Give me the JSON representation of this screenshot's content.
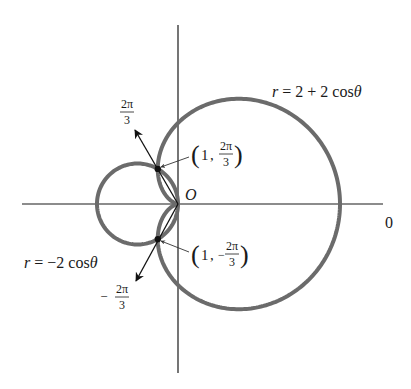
{
  "figure": {
    "type": "polar-graph",
    "origin_label": "O",
    "polar_axis_label": "0",
    "colors": {
      "curve": "#6b6b6b",
      "axis": "#1a1a1a",
      "point": "#111111",
      "text": "#1a1a1a",
      "background": "#ffffff"
    },
    "geometry": {
      "origin_px": [
        178,
        204
      ],
      "scale_px_per_unit": 40.5
    }
  },
  "curves": [
    {
      "id": "cardioid",
      "equation_label": {
        "lhs": "r",
        "eq": " = ",
        "rhs": "2 + 2 cos",
        "theta": "θ"
      },
      "formula": "r = 2 + 2cosθ"
    },
    {
      "id": "circle",
      "equation_label": {
        "lhs": "r",
        "eq": " = ",
        "rhs": "−2 cos",
        "theta": "θ"
      },
      "formula": "r = −2cosθ"
    }
  ],
  "rays": [
    {
      "angle_label": {
        "sign": "",
        "num": "2π",
        "den": "3"
      },
      "angle": "2π/3"
    },
    {
      "angle_label": {
        "sign": "−",
        "num": "2π",
        "den": "3"
      },
      "angle": "−2π/3"
    }
  ],
  "intersections": [
    {
      "r": "1",
      "sign": "",
      "num": "2π",
      "den": "3",
      "label": "(1, 2π/3)"
    },
    {
      "r": "1",
      "sign": "−",
      "num": "2π",
      "den": "3",
      "label": "(1, −2π/3)"
    }
  ]
}
